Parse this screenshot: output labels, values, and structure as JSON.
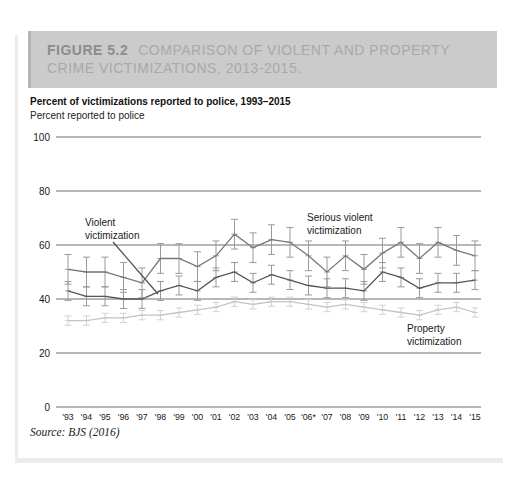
{
  "figure_header": {
    "label": "FIGURE 5.2",
    "title": "COMPARISON OF VIOLENT AND PROPERTY CRIME VICTIMIZATIONS, 2013-2015.",
    "bg_color": "#cbcbcb",
    "label_color": "#8d8d8d",
    "title_color": "#a9a9a9"
  },
  "chart": {
    "title": "Percent of victimizations reported to police, 1993–2015",
    "subtitle": "Percent reported to police",
    "source": "Source: BJS (2016)"
  },
  "chart_data": {
    "type": "line",
    "title": "Percent of victimizations reported to police, 1993–2015",
    "ylabel": "Percent reported to police",
    "ylim": [
      0,
      100
    ],
    "yticks": [
      0,
      20,
      40,
      60,
      80,
      100
    ],
    "grid": true,
    "grid_color": "#4d4d4d",
    "error_bars": true,
    "legend_position": "inline-annotations",
    "categories": [
      "'93",
      "'94",
      "'95",
      "'96",
      "'97",
      "'98",
      "'99",
      "'00",
      "'01",
      "'02",
      "'03",
      "'04",
      "'05",
      "'06*",
      "'07",
      "'08",
      "'09",
      "'10",
      "'11",
      "'12",
      "'13",
      "'14",
      "'15"
    ],
    "series": [
      {
        "name": "Serious violent victimization",
        "label_lines": [
          "Serious violent",
          "victimization"
        ],
        "color": "#777777",
        "error_color": "#9a9a9a",
        "ci": 5.5,
        "values": [
          51,
          50,
          50,
          48,
          46,
          55,
          55,
          52,
          56,
          64,
          59,
          62,
          61,
          56,
          50,
          56,
          51,
          57,
          61,
          55,
          61,
          58,
          56
        ]
      },
      {
        "name": "Violent victimization",
        "label_lines": [
          "Violent",
          "victimization"
        ],
        "color": "#555555",
        "error_color": "#9a9a9a",
        "ci": 3.5,
        "values": [
          43,
          41,
          41,
          40,
          40,
          43,
          45,
          43,
          48,
          50,
          46,
          49,
          47,
          45,
          44,
          44,
          43,
          50,
          48,
          44,
          46,
          46,
          47
        ]
      },
      {
        "name": "Property victimization",
        "label_lines": [
          "Property",
          "victimization"
        ],
        "color": "#c4c4c4",
        "error_color": "#d2d2d2",
        "ci": 1.7,
        "values": [
          32,
          32,
          33,
          33,
          34,
          34,
          35,
          36,
          37,
          39,
          38,
          39,
          39,
          38,
          37,
          38,
          37,
          36,
          35,
          34,
          36,
          37,
          35
        ]
      }
    ]
  }
}
